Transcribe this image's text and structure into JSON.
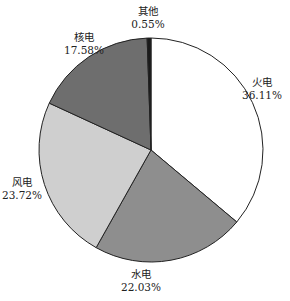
{
  "chart_data": {
    "type": "pie",
    "title": "",
    "start_angle_deg": 0,
    "direction": "clockwise",
    "slices": [
      {
        "name": "火电",
        "value": 36.11,
        "label": "36.11%",
        "color": "#ffffff"
      },
      {
        "name": "水电",
        "value": 22.03,
        "label": "22.03%",
        "color": "#8e8e8e"
      },
      {
        "name": "风电",
        "value": 23.72,
        "label": "23.72%",
        "color": "#cfcfcf"
      },
      {
        "name": "核电",
        "value": 17.58,
        "label": "17.58%",
        "color": "#6e6e6e"
      },
      {
        "name": "其他",
        "value": 0.55,
        "label": "0.55%",
        "color": "#1a1a1a"
      }
    ]
  },
  "labels": {
    "thermal": {
      "name": "火电",
      "pct": "36.11%"
    },
    "hydro": {
      "name": "水电",
      "pct": "22.03%"
    },
    "wind": {
      "name": "风电",
      "pct": "23.72%"
    },
    "nuclear": {
      "name": "核电",
      "pct": "17.58%"
    },
    "other": {
      "name": "其他",
      "pct": "0.55%"
    }
  }
}
